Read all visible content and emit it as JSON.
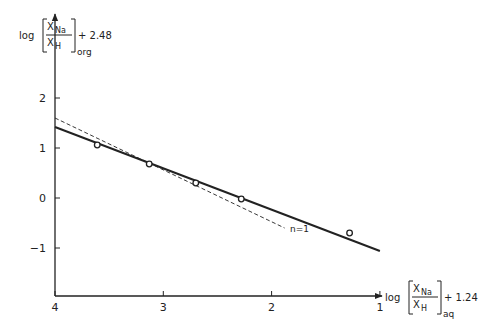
{
  "chart_data": {
    "type": "scatter",
    "title": "",
    "ylabel": {
      "prefix": "log",
      "numerator": "X",
      "numerator_sub": "Na",
      "denominator": "X",
      "denominator_sub": "H",
      "bracket_sub": "org",
      "suffix": "+ 2.48"
    },
    "xlabel": {
      "prefix": "log",
      "numerator": "X",
      "numerator_sub": "Na",
      "denominator": "X",
      "denominator_sub": "H",
      "bracket_sub": "aq",
      "suffix": "+ 1.24"
    },
    "xlim": [
      4,
      1
    ],
    "ylim": [
      -2,
      2.9
    ],
    "x_axis_reversed": true,
    "grid": false,
    "xticks": [
      4,
      3,
      2,
      1
    ],
    "xtick_labels": [
      "4",
      "3",
      "2",
      "1"
    ],
    "yticks": [
      2,
      1,
      0,
      -1
    ],
    "ytick_labels": [
      "2",
      "1",
      "0",
      "-1"
    ],
    "series": [
      {
        "name": "experimental points",
        "style": "open-circle",
        "x": [
          3.61,
          3.13,
          2.7,
          2.28,
          1.28
        ],
        "y": [
          1.06,
          0.68,
          0.3,
          -0.02,
          -0.7
        ]
      },
      {
        "name": "fitted line",
        "style": "solid",
        "x": [
          4.0,
          1.0
        ],
        "y": [
          1.42,
          -1.06
        ]
      },
      {
        "name": "n=1",
        "style": "dashed",
        "x": [
          4.0,
          1.88
        ],
        "y": [
          1.6,
          -0.6
        ]
      }
    ],
    "annotations": [
      {
        "text": "n=1",
        "x": 1.83,
        "y": -0.6
      }
    ],
    "legend": null
  }
}
